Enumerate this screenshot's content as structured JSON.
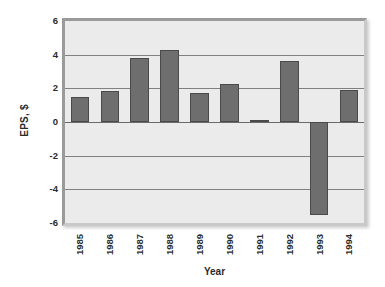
{
  "chart_data": {
    "type": "bar",
    "title": "",
    "subtitle": "",
    "xlabel": "Year",
    "ylabel": "EPS, $",
    "categories": [
      "1985",
      "1986",
      "1987",
      "1988",
      "1989",
      "1990",
      "1991",
      "1992",
      "1993",
      "1994"
    ],
    "values": [
      1.5,
      1.85,
      3.8,
      4.3,
      1.75,
      2.25,
      0.1,
      3.6,
      -5.5,
      1.9
    ],
    "series": [
      {
        "name": "EPS",
        "values": [
          1.5,
          1.85,
          3.8,
          4.3,
          1.75,
          2.25,
          0.1,
          3.6,
          -5.5,
          1.9
        ]
      }
    ],
    "ylim": [
      -6,
      6
    ],
    "yticks": [
      6,
      4,
      2,
      0,
      -2,
      -4,
      -6
    ],
    "ytick_labels": [
      "6",
      "4",
      "2",
      "0",
      "-2",
      "-4",
      "-6"
    ],
    "grid": true,
    "grid_axis": "y",
    "legend": false,
    "legend_position": "none",
    "bar_color": "#6e6e6e",
    "bar_border_color": "#4a4a4a",
    "plot_background": "#ebebeb",
    "gridline_color": "#808080",
    "figure_background": "#ffffff",
    "text_color": "#2b2b2b",
    "xtick_rotation": -90
  }
}
